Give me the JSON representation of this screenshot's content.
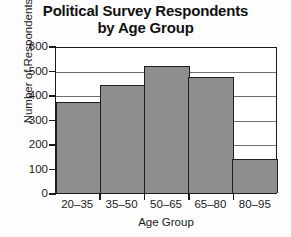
{
  "chart_data": {
    "type": "bar",
    "title": "Political Survey Respondents by Age Group",
    "title_lines": [
      "Political Survey Respondents",
      "by Age Group"
    ],
    "xlabel": "Age Group",
    "ylabel": "Number of Respondents",
    "categories": [
      "20–35",
      "35–50",
      "50–65",
      "65–80",
      "80–95"
    ],
    "values": [
      375,
      445,
      525,
      480,
      140
    ],
    "ylim": [
      0,
      600
    ],
    "ytick_labels": [
      "600",
      "500",
      "400",
      "300",
      "200",
      "100",
      "0"
    ],
    "ytick_values": [
      600,
      500,
      400,
      300,
      200,
      100,
      0
    ],
    "grid": "horizontal",
    "legend": "none",
    "bar_color": "#8e8e8e",
    "bar_edge_color": "#1f1f1f",
    "axis_color": "#1a1a1a",
    "background_color": "#fdfdfd"
  }
}
